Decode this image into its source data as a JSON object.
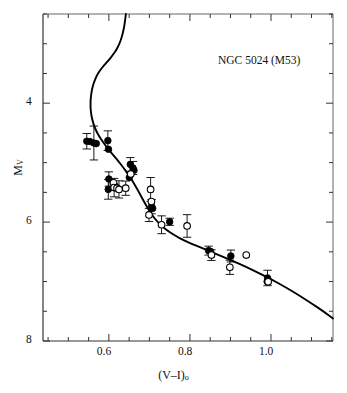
{
  "figure": {
    "annotation": "NGC 5024 (M53)",
    "xlabel_main": "(V–I)",
    "xlabel_sub": "o",
    "ylabel_main": "M",
    "ylabel_sub": "V"
  },
  "chart_data": {
    "type": "scatter",
    "title": "",
    "annotation": "NGC 5024 (M53)",
    "xlabel": "(V-I)_o",
    "ylabel": "M_V",
    "xlim": [
      0.4375,
      1.153
    ],
    "ylim": [
      8.0,
      2.5
    ],
    "y_inverted": true,
    "grid": false,
    "legend": "none",
    "xticks_major": [
      0.6,
      0.8,
      1.0
    ],
    "xtick_labels": [
      "0.6",
      "0.8",
      "1.0"
    ],
    "xticks_minor": [
      0.45,
      0.5,
      0.55,
      0.65,
      0.7,
      0.75,
      0.85,
      0.9,
      0.95,
      1.05,
      1.1,
      1.15
    ],
    "yticks_major": [
      4,
      6,
      8
    ],
    "ytick_labels": [
      "4",
      "6",
      "8"
    ],
    "yticks_minor": [
      2.5,
      3.0,
      3.5,
      4.5,
      5.0,
      5.5,
      6.5,
      7.0,
      7.5
    ],
    "series": [
      {
        "name": "filled-circles",
        "marker": "filled-circle",
        "color": "#000000",
        "points": [
          {
            "x": 0.5455,
            "y": 4.64,
            "yerr": 0.13
          },
          {
            "x": 0.553,
            "y": 4.645,
            "yerr": 0.0
          },
          {
            "x": 0.563,
            "y": 4.67,
            "yerr": 0.285
          },
          {
            "x": 0.569,
            "y": 4.68,
            "yerr": 0.0
          },
          {
            "x": 0.5975,
            "y": 4.63,
            "yerr": 0.165
          },
          {
            "x": 0.599,
            "y": 4.775,
            "yerr": 0.0
          },
          {
            "x": 0.6,
            "y": 5.275,
            "yerr": 0.12
          },
          {
            "x": 0.5985,
            "y": 5.45,
            "yerr": 0.165
          },
          {
            "x": 0.615,
            "y": 5.39,
            "yerr": 0.0
          },
          {
            "x": 0.653,
            "y": 5.03,
            "yerr": 0.115
          },
          {
            "x": 0.6595,
            "y": 5.09,
            "yerr": 0.11
          },
          {
            "x": 0.662,
            "y": 5.13,
            "yerr": 0.0
          },
          {
            "x": 0.6505,
            "y": 5.25,
            "yerr": 0.0
          },
          {
            "x": 0.7055,
            "y": 5.74,
            "yerr": 0.12
          },
          {
            "x": 0.708,
            "y": 5.77,
            "yerr": 0.0
          },
          {
            "x": 0.75,
            "y": 5.995,
            "yerr": 0.06
          },
          {
            "x": 0.846,
            "y": 6.48,
            "yerr": 0.075
          },
          {
            "x": 0.851,
            "y": 6.495,
            "yerr": 0.0
          },
          {
            "x": 0.901,
            "y": 6.57,
            "yerr": 0.1
          },
          {
            "x": 0.9915,
            "y": 6.94,
            "yerr": 0.13
          },
          {
            "x": 0.9905,
            "y": 7.0,
            "yerr": 0.0
          }
        ]
      },
      {
        "name": "open-circles",
        "marker": "open-circle",
        "color": "#000000",
        "points": [
          {
            "x": 0.6115,
            "y": 5.34,
            "yerr": 0.0
          },
          {
            "x": 0.613,
            "y": 5.42,
            "yerr": 0.155
          },
          {
            "x": 0.62,
            "y": 5.43,
            "yerr": 0.0
          },
          {
            "x": 0.625,
            "y": 5.45,
            "yerr": 0.145
          },
          {
            "x": 0.6415,
            "y": 5.43,
            "yerr": 0.12
          },
          {
            "x": 0.654,
            "y": 5.19,
            "yerr": 0.0
          },
          {
            "x": 0.703,
            "y": 5.45,
            "yerr": 0.2
          },
          {
            "x": 0.705,
            "y": 5.655,
            "yerr": 0.0
          },
          {
            "x": 0.699,
            "y": 5.88,
            "yerr": 0.11
          },
          {
            "x": 0.73,
            "y": 6.045,
            "yerr": 0.15
          },
          {
            "x": 0.793,
            "y": 6.065,
            "yerr": 0.19
          },
          {
            "x": 0.853,
            "y": 6.555,
            "yerr": 0.09
          },
          {
            "x": 0.8985,
            "y": 6.76,
            "yerr": 0.12
          },
          {
            "x": 0.939,
            "y": 6.555,
            "yerr": 0.0
          },
          {
            "x": 0.993,
            "y": 7.005,
            "yerr": 0.0
          }
        ]
      }
    ],
    "isochrone": {
      "name": "isochrone-curve",
      "style": "solid",
      "color": "#000000",
      "linewidth": 1.9,
      "points": [
        [
          0.642,
          2.5
        ],
        [
          0.64,
          2.62
        ],
        [
          0.6365,
          2.76
        ],
        [
          0.632,
          2.89
        ],
        [
          0.6255,
          3.01
        ],
        [
          0.6175,
          3.115
        ],
        [
          0.608,
          3.205
        ],
        [
          0.5985,
          3.285
        ],
        [
          0.5885,
          3.36
        ],
        [
          0.579,
          3.44
        ],
        [
          0.5705,
          3.53
        ],
        [
          0.5635,
          3.64
        ],
        [
          0.5585,
          3.76
        ],
        [
          0.5555,
          3.89
        ],
        [
          0.5545,
          4.02
        ],
        [
          0.5555,
          4.15
        ],
        [
          0.559,
          4.28
        ],
        [
          0.5645,
          4.4
        ],
        [
          0.572,
          4.51
        ],
        [
          0.581,
          4.61
        ],
        [
          0.591,
          4.705
        ],
        [
          0.602,
          4.8
        ],
        [
          0.6135,
          4.895
        ],
        [
          0.625,
          4.99
        ],
        [
          0.6365,
          5.09
        ],
        [
          0.6475,
          5.195
        ],
        [
          0.658,
          5.305
        ],
        [
          0.668,
          5.42
        ],
        [
          0.6775,
          5.54
        ],
        [
          0.687,
          5.66
        ],
        [
          0.6965,
          5.775
        ],
        [
          0.707,
          5.885
        ],
        [
          0.7185,
          5.985
        ],
        [
          0.732,
          6.075
        ],
        [
          0.747,
          6.155
        ],
        [
          0.764,
          6.23
        ],
        [
          0.783,
          6.3
        ],
        [
          0.804,
          6.365
        ],
        [
          0.827,
          6.43
        ],
        [
          0.852,
          6.5
        ],
        [
          0.879,
          6.575
        ],
        [
          0.908,
          6.66
        ],
        [
          0.939,
          6.755
        ],
        [
          0.971,
          6.86
        ],
        [
          1.004,
          6.975
        ],
        [
          1.037,
          7.1
        ],
        [
          1.07,
          7.235
        ],
        [
          1.102,
          7.375
        ],
        [
          1.133,
          7.52
        ],
        [
          1.153,
          7.62
        ]
      ]
    }
  }
}
